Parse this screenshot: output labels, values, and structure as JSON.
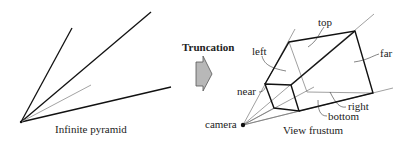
{
  "left_diagram": {
    "caption": "Infinite pyramid"
  },
  "arrow": {
    "label": "Truncation",
    "fill_color": "#b8b8b8"
  },
  "right_diagram": {
    "caption": "View frustum",
    "labels": {
      "top": "top",
      "left": "left",
      "far": "far",
      "near": "near",
      "right": "right",
      "bottom": "bottom",
      "camera": "camera"
    }
  }
}
